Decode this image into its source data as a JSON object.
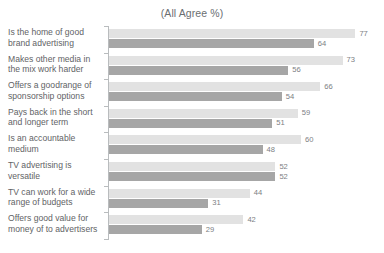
{
  "chart_data": {
    "type": "bar",
    "orientation": "horizontal",
    "title": "(All Agree %)",
    "xlabel": "",
    "ylabel": "",
    "xlim": [
      0,
      80
    ],
    "grid": false,
    "legend": "none",
    "value_suffix": "",
    "colors": {
      "series_light": "#e2e2e2",
      "series_dark": "#a6a6a6",
      "axis": "#b9bcbe",
      "text": "#5f6366",
      "value_text": "#7c8083"
    },
    "categories": [
      "Is the home of good brand advertising",
      "Makes other media in the mix work harder",
      "Offers a goodrange of sponsorship options",
      "Pays back in the short and longer term",
      "Is an accountable medium",
      "TV advertising is versatile",
      "TV can work for a wide range of budgets",
      "Offers good value for money of to advertisers"
    ],
    "series": [
      {
        "name": "Series 1",
        "color": "#e2e2e2",
        "values": [
          77,
          73,
          66,
          59,
          60,
          52,
          44,
          42
        ]
      },
      {
        "name": "Series 2",
        "color": "#a6a6a6",
        "values": [
          64,
          56,
          54,
          51,
          48,
          52,
          31,
          29
        ]
      }
    ]
  }
}
